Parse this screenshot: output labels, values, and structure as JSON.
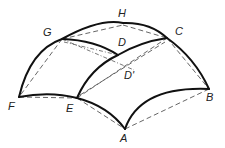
{
  "diagram": {
    "type": "curved-surface-geometry",
    "labels": {
      "H": "H",
      "G": "G",
      "C": "C",
      "D": "D",
      "D_prime": "D'",
      "F": "F",
      "E": "E",
      "B": "B",
      "A": "A"
    },
    "colors": {
      "stroke": "#111111",
      "dashed": "#555555",
      "background": "#ffffff"
    }
  }
}
